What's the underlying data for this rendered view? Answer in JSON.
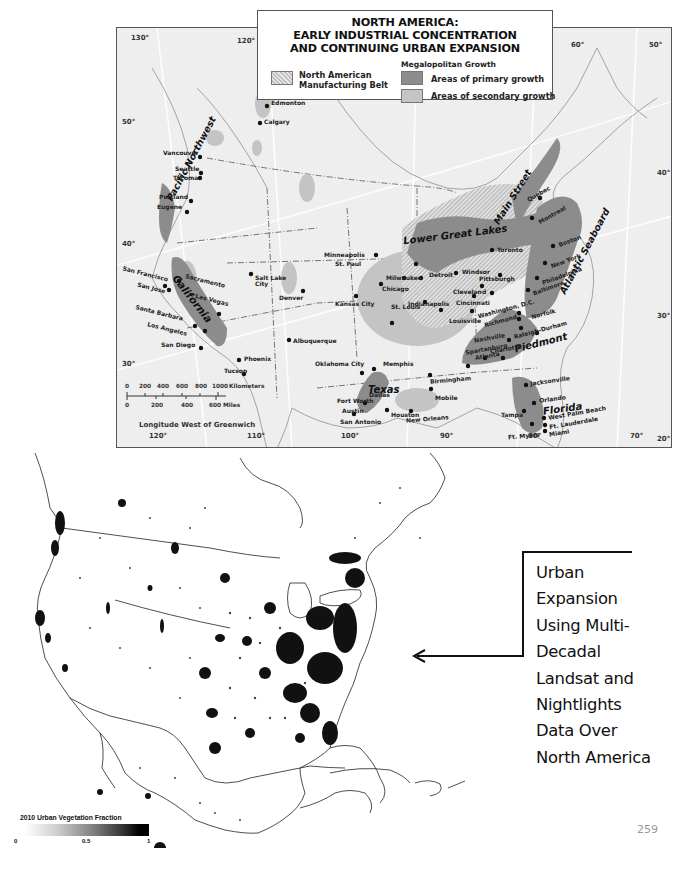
{
  "reference_map": {
    "title_lines": [
      "NORTH AMERICA:",
      "EARLY INDUSTRIAL CONCENTRATION",
      "AND CONTINUING URBAN EXPANSION"
    ],
    "legend": {
      "group_heading": "Megalopolitan Growth",
      "items": [
        {
          "id": "belt",
          "label_lines": [
            "North American",
            "Manufacturing Belt"
          ],
          "pattern": "hatched",
          "color": "#d8d8d8"
        },
        {
          "id": "primary",
          "label": "Areas of primary growth",
          "color": "#8c8c8c"
        },
        {
          "id": "secondary",
          "label": "Areas of secondary growth",
          "color": "#c4c4c4"
        }
      ]
    },
    "regions": [
      "Pacific Northwest",
      "California",
      "Lower Great Lakes",
      "Main Street",
      "Atlantic Seaboard",
      "Piedmont",
      "Texas",
      "Florida"
    ],
    "cities": [
      "Edmonton",
      "Calgary",
      "Vancouver",
      "Seattle",
      "Tacoma",
      "Portland",
      "Eugene",
      "San Francisco",
      "Sacramento",
      "San Jose",
      "Las Vegas",
      "Santa Barbara",
      "Los Angeles",
      "San Diego",
      "Salt Lake City",
      "Denver",
      "Phoenix",
      "Tucson",
      "Albuquerque",
      "Minneapolis",
      "St. Paul",
      "Milwaukee",
      "Chicago",
      "Detroit",
      "Windsor",
      "Toronto",
      "Cleveland",
      "Pittsburgh",
      "Indianapolis",
      "Cincinnati",
      "Kansas City",
      "St. Louis",
      "Louisville",
      "Quebec",
      "Montreal",
      "Boston",
      "New York",
      "Philadelphia",
      "Baltimore",
      "Washington, D.C.",
      "Richmond",
      "Norfolk",
      "Raleigh-Durham",
      "Nashville",
      "Spartanburg",
      "Charlotte",
      "Atlanta",
      "Birmingham",
      "Memphis",
      "Oklahoma City",
      "Fort Worth",
      "Dallas",
      "Austin",
      "San Antonio",
      "Houston",
      "New Orleans",
      "Mobile",
      "Jacksonville",
      "Orlando",
      "Tampa",
      "West Palm Beach",
      "Ft. Lauderdale",
      "Miami",
      "Ft. Myers"
    ],
    "longitude_ticks_top": [
      "130°",
      "120°",
      "60°",
      "50°"
    ],
    "longitude_ticks_bottom": [
      "120°",
      "110°",
      "100°",
      "90°",
      "80°",
      "70°"
    ],
    "latitude_ticks_left": [
      "50°",
      "40°",
      "30°"
    ],
    "latitude_ticks_right": [
      "40°",
      "30°",
      "20°"
    ],
    "scale_bar": {
      "km_ticks": [
        "0",
        "200",
        "400",
        "600",
        "800",
        "1000"
      ],
      "km_unit": "Kilometers",
      "mi_ticks": [
        "0",
        "200",
        "400",
        "600"
      ],
      "mi_unit": "Miles"
    },
    "axis_title": "Longitude West of Greenwich"
  },
  "satellite_map": {
    "legend": {
      "title": "2010 Urban Vegetation Fraction",
      "ticks": [
        "0",
        "0.5",
        "1"
      ],
      "color_low": "#ffffff",
      "color_high": "#000000"
    }
  },
  "annotation": {
    "lines": [
      "Urban",
      "Expansion",
      "Using Multi-",
      "Decadal",
      "Landsat and",
      "Nightlights",
      "Data Over",
      "North America"
    ]
  },
  "page_number": "259"
}
